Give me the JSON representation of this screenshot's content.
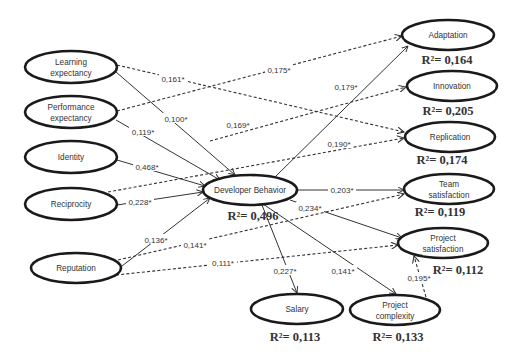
{
  "diagram": {
    "type": "structural-equation-model",
    "nodes": [
      {
        "id": "learning",
        "lines": [
          "Learning",
          "expectancy"
        ],
        "cx": 71,
        "cy": 67,
        "rx": 46,
        "ry": 16
      },
      {
        "id": "performance",
        "lines": [
          "Performance",
          "expectancy"
        ],
        "cx": 71,
        "cy": 112,
        "rx": 46,
        "ry": 16
      },
      {
        "id": "identity",
        "lines": [
          "Identity"
        ],
        "cx": 71,
        "cy": 157,
        "rx": 46,
        "ry": 16
      },
      {
        "id": "reciprocity",
        "lines": [
          "Reciprocity"
        ],
        "cx": 71,
        "cy": 204,
        "rx": 46,
        "ry": 16
      },
      {
        "id": "reputation",
        "lines": [
          "Reputation"
        ],
        "cx": 76,
        "cy": 268,
        "rx": 45,
        "ry": 15
      },
      {
        "id": "developer",
        "lines": [
          "Developer Behavior"
        ],
        "cx": 250,
        "cy": 190,
        "rx": 47,
        "ry": 15,
        "r2": "R²= 0,496",
        "r2x": 253,
        "r2y": 220
      },
      {
        "id": "adaptation",
        "lines": [
          "Adaptation"
        ],
        "cx": 448,
        "cy": 35,
        "rx": 46,
        "ry": 15,
        "r2": "R²= 0,164",
        "r2x": 447,
        "r2y": 64
      },
      {
        "id": "innovation",
        "lines": [
          "Innovation"
        ],
        "cx": 452,
        "cy": 86,
        "rx": 45,
        "ry": 15,
        "r2": "R²= 0,205",
        "r2x": 448,
        "r2y": 115
      },
      {
        "id": "replication",
        "lines": [
          "Replication"
        ],
        "cx": 450,
        "cy": 137,
        "rx": 45,
        "ry": 15,
        "r2": "R²= 0,174",
        "r2x": 442,
        "r2y": 164
      },
      {
        "id": "team",
        "lines": [
          "Team",
          "satisfaction"
        ],
        "cx": 449,
        "cy": 189,
        "rx": 45,
        "ry": 15,
        "r2": "R²= 0,119",
        "r2x": 440,
        "r2y": 216
      },
      {
        "id": "projsat",
        "lines": [
          "Project",
          "satisfaction"
        ],
        "cx": 443,
        "cy": 243,
        "rx": 45,
        "ry": 15,
        "r2": "R²= 0,112",
        "r2x": 458,
        "r2y": 274
      },
      {
        "id": "salary",
        "lines": [
          "Salary"
        ],
        "cx": 297,
        "cy": 309,
        "rx": 46,
        "ry": 15,
        "r2": "R²= 0,113",
        "r2x": 295,
        "r2y": 341
      },
      {
        "id": "projcomp",
        "lines": [
          "Project",
          "complexity"
        ],
        "cx": 395,
        "cy": 310,
        "rx": 45,
        "ry": 15,
        "r2": "R²= 0,133",
        "r2x": 398,
        "r2y": 341
      }
    ],
    "edges": [
      {
        "from": "learning",
        "to": "developer",
        "style": "solid",
        "label": "0,100*",
        "x1": 116,
        "y1": 72,
        "x2": 235,
        "y2": 175,
        "lx": 176,
        "ly": 119
      },
      {
        "from": "learning",
        "to": "replication",
        "style": "dashed",
        "label": "0,161*",
        "x1": 117,
        "y1": 65,
        "x2": 404,
        "y2": 132,
        "lx": 173,
        "ly": 79
      },
      {
        "from": "performance",
        "to": "developer",
        "style": "solid",
        "label": "0,119*",
        "x1": 116,
        "y1": 120,
        "x2": 220,
        "y2": 180,
        "lx": 143,
        "ly": 132
      },
      {
        "from": "performance",
        "to": "adaptation",
        "style": "dashed",
        "label": "0,175*",
        "x1": 117,
        "y1": 111,
        "x2": 402,
        "y2": 36,
        "lx": 279,
        "ly": 70
      },
      {
        "from": "identity",
        "to": "developer",
        "style": "solid",
        "label": "0,468*",
        "x1": 117,
        "y1": 160,
        "x2": 205,
        "y2": 186,
        "lx": 147,
        "ly": 167
      },
      {
        "from": "identity",
        "to": "innovation",
        "style": "dashed",
        "label": "0,169*",
        "x1": 210,
        "y1": 141,
        "x2": 406,
        "y2": 87,
        "lx": 238,
        "ly": 125
      },
      {
        "from": "reciprocity",
        "to": "developer",
        "style": "solid",
        "label": "0,228*",
        "x1": 117,
        "y1": 205,
        "x2": 203,
        "y2": 192,
        "lx": 140,
        "ly": 202
      },
      {
        "from": "reciprocity",
        "to": "replication",
        "style": "dashed",
        "label": "0,190*",
        "x1": 108,
        "y1": 192,
        "x2": 404,
        "y2": 138,
        "lx": 339,
        "ly": 144
      },
      {
        "from": "reputation",
        "to": "developer",
        "style": "solid",
        "label": "0,136*",
        "x1": 122,
        "y1": 266,
        "x2": 210,
        "y2": 198,
        "lx": 156,
        "ly": 240
      },
      {
        "from": "reputation",
        "to": "team",
        "style": "dashed",
        "label": "0,141*",
        "x1": 118,
        "y1": 260,
        "x2": 404,
        "y2": 194,
        "lx": 195,
        "ly": 245
      },
      {
        "from": "reputation",
        "to": "projsat",
        "style": "dashed",
        "label": "0,111*",
        "x1": 116,
        "y1": 275,
        "x2": 398,
        "y2": 245,
        "lx": 223,
        "ly": 263
      },
      {
        "from": "developer",
        "to": "adaptation",
        "style": "solid",
        "label": "0,179*",
        "x1": 275,
        "y1": 177,
        "x2": 408,
        "y2": 46,
        "lx": 346,
        "ly": 87
      },
      {
        "from": "developer",
        "to": "team",
        "style": "solid",
        "label": "0,203*",
        "x1": 297,
        "y1": 190,
        "x2": 404,
        "y2": 190,
        "lx": 342,
        "ly": 190
      },
      {
        "from": "developer",
        "to": "projsat",
        "style": "solid",
        "label": "0,234*",
        "x1": 290,
        "y1": 200,
        "x2": 402,
        "y2": 238,
        "lx": 310,
        "ly": 208
      },
      {
        "from": "developer",
        "to": "salary",
        "style": "solid",
        "label": "0,227*",
        "x1": 262,
        "y1": 205,
        "x2": 297,
        "y2": 293,
        "lx": 285,
        "ly": 271
      },
      {
        "from": "developer",
        "to": "projcomp",
        "style": "solid",
        "label": "0,141*",
        "x1": 263,
        "y1": 204,
        "x2": 396,
        "y2": 294,
        "lx": 343,
        "ly": 271
      },
      {
        "from": "projcomp",
        "to": "projsat",
        "style": "dashed",
        "label": "0,195*",
        "x1": 426,
        "y1": 297,
        "x2": 414,
        "y2": 256,
        "lx": 419,
        "ly": 278
      }
    ]
  }
}
